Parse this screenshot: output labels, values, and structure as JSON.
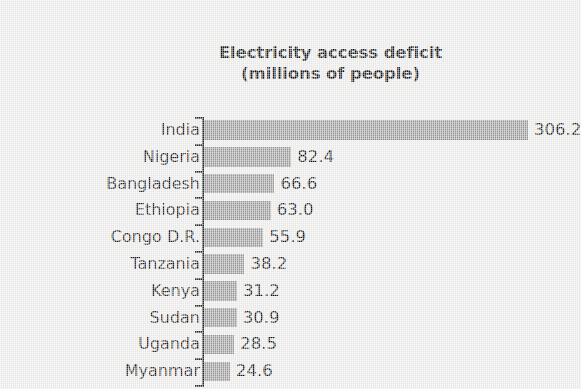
{
  "chart_data": {
    "type": "bar",
    "orientation": "horizontal",
    "title": "Electricity access deficit (millions of people)",
    "title_lines": [
      "Electricity access deficit",
      "(millions of people)"
    ],
    "xlabel": "",
    "ylabel": "",
    "unit": "millions of people",
    "grid": false,
    "legend": null,
    "axis_visible": {
      "category_axis": true,
      "value_axis": false
    },
    "xlim": [
      0,
      306.2
    ],
    "categories": [
      "India",
      "Nigeria",
      "Bangladesh",
      "Ethiopia",
      "Congo D.R.",
      "Tanzania",
      "Kenya",
      "Sudan",
      "Uganda",
      "Myanmar"
    ],
    "values": [
      306.2,
      82.4,
      66.6,
      63.0,
      55.9,
      38.2,
      31.2,
      30.9,
      28.5,
      24.6
    ],
    "value_labels": [
      "306.2",
      "82.4",
      "66.6",
      "63.0",
      "55.9",
      "38.2",
      "31.2",
      "30.9",
      "28.5",
      "24.6"
    ],
    "bars": [
      {
        "category": "India",
        "value": 306.2,
        "label": "306.2"
      },
      {
        "category": "Nigeria",
        "value": 82.4,
        "label": "82.4"
      },
      {
        "category": "Bangladesh",
        "value": 66.6,
        "label": "66.6"
      },
      {
        "category": "Ethiopia",
        "value": 63.0,
        "label": "63.0"
      },
      {
        "category": "Congo D.R.",
        "value": 55.9,
        "label": "55.9"
      },
      {
        "category": "Tanzania",
        "value": 38.2,
        "label": "38.2"
      },
      {
        "category": "Kenya",
        "value": 31.2,
        "label": "31.2"
      },
      {
        "category": "Sudan",
        "value": 30.9,
        "label": "30.9"
      },
      {
        "category": "Uganda",
        "value": 28.5,
        "label": "28.5"
      },
      {
        "category": "Myanmar",
        "value": 24.6,
        "label": "24.6"
      }
    ],
    "colors": {
      "background": "#edeceb",
      "bar_fill": "#9b9b9b",
      "axis": "#2b2b2b",
      "text": "#1a1a1a"
    }
  }
}
